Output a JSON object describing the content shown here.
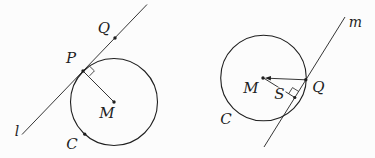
{
  "colors": {
    "background": "#fcfcfc",
    "ink": "#1f1f1f"
  },
  "left_figure": {
    "labels": {
      "line": "l",
      "point_P": "P",
      "point_Q": "Q",
      "center_M": "M",
      "circle_C": "C"
    }
  },
  "right_figure": {
    "labels": {
      "line": "m",
      "center_M": "M",
      "point_S": "S",
      "point_Q": "Q",
      "circle_C": "C"
    }
  }
}
